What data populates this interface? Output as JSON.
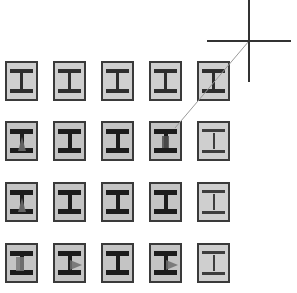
{
  "diagram": {
    "symbol": "i-beam-column",
    "grid": {
      "rows": 4,
      "columns": 5,
      "tiles": [
        {
          "row": 0,
          "col": 0,
          "style": "normal",
          "marker": null
        },
        {
          "row": 0,
          "col": 1,
          "style": "normal",
          "marker": null
        },
        {
          "row": 0,
          "col": 2,
          "style": "normal",
          "marker": null
        },
        {
          "row": 0,
          "col": 3,
          "style": "normal",
          "marker": null
        },
        {
          "row": 0,
          "col": 4,
          "style": "normal",
          "marker": null
        },
        {
          "row": 1,
          "col": 0,
          "style": "dark",
          "marker": "tri-up"
        },
        {
          "row": 1,
          "col": 1,
          "style": "dark",
          "marker": null
        },
        {
          "row": 1,
          "col": 2,
          "style": "dark",
          "marker": null
        },
        {
          "row": 1,
          "col": 3,
          "style": "dark",
          "marker": "block"
        },
        {
          "row": 1,
          "col": 4,
          "style": "light",
          "marker": null
        },
        {
          "row": 2,
          "col": 0,
          "style": "dark",
          "marker": "tri-up"
        },
        {
          "row": 2,
          "col": 1,
          "style": "dark",
          "marker": null
        },
        {
          "row": 2,
          "col": 2,
          "style": "dark",
          "marker": null
        },
        {
          "row": 2,
          "col": 3,
          "style": "dark",
          "marker": null
        },
        {
          "row": 2,
          "col": 4,
          "style": "light",
          "marker": null
        },
        {
          "row": 3,
          "col": 0,
          "style": "dark",
          "marker": "block-wide"
        },
        {
          "row": 3,
          "col": 1,
          "style": "dark",
          "marker": "tri-right"
        },
        {
          "row": 3,
          "col": 2,
          "style": "dark",
          "marker": null
        },
        {
          "row": 3,
          "col": 3,
          "style": "dark",
          "marker": "tri-right"
        },
        {
          "row": 3,
          "col": 4,
          "style": "light",
          "marker": null
        }
      ]
    },
    "cursor": {
      "type": "crosshair",
      "x": 249,
      "y": 41
    },
    "rubber_band": {
      "from": [
        249,
        41
      ],
      "to": [
        175,
        128
      ]
    },
    "colors": {
      "tile_fill": "#cfcfcf",
      "tile_border": "#3a3a3a",
      "beam": "#2e2e2e",
      "background": "#ffffff",
      "crosshair": "#333333",
      "rubber_band": "#9a9a9a"
    }
  }
}
